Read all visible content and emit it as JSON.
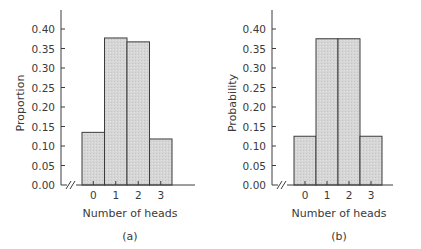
{
  "chart_data": [
    {
      "type": "bar",
      "panel": "(a)",
      "caption": "(a)",
      "title": "",
      "xlabel": "Number of heads",
      "ylabel": "Proportion",
      "categories": [
        "0",
        "1",
        "2",
        "3"
      ],
      "values": [
        0.135,
        0.377,
        0.367,
        0.118
      ],
      "ylim": [
        0,
        0.45
      ],
      "yticks": [
        "0.00",
        "0.05",
        "0.10",
        "0.15",
        "0.20",
        "0.25",
        "0.30",
        "0.35",
        "0.40"
      ],
      "grid": false,
      "legend": null,
      "axis_break": true
    },
    {
      "type": "bar",
      "panel": "(b)",
      "caption": "(b)",
      "title": "",
      "xlabel": "Number of heads",
      "ylabel": "Probability",
      "categories": [
        "0",
        "1",
        "2",
        "3"
      ],
      "values": [
        0.125,
        0.375,
        0.375,
        0.125
      ],
      "ylim": [
        0,
        0.45
      ],
      "yticks": [
        "0.00",
        "0.05",
        "0.10",
        "0.15",
        "0.20",
        "0.25",
        "0.30",
        "0.35",
        "0.40"
      ],
      "grid": false,
      "legend": null,
      "axis_break": true
    }
  ],
  "style": {
    "bar_fill": "#d4d4d4",
    "bar_stroke": "#3c3c3c",
    "axis_color": "#3c3c3c",
    "text_color": "#3a3a3a"
  }
}
